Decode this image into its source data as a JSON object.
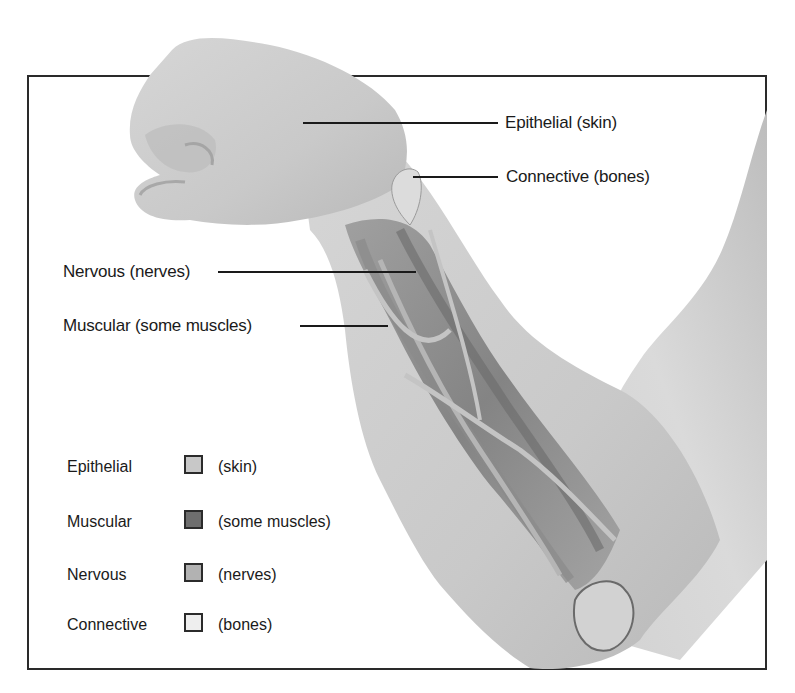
{
  "diagram": {
    "callouts": [
      {
        "id": "epithelial",
        "label": "Epithelial (skin)"
      },
      {
        "id": "connective",
        "label": "Connective (bones)"
      },
      {
        "id": "nervous",
        "label": "Nervous (nerves)"
      },
      {
        "id": "muscular",
        "label": "Muscular (some muscles)"
      }
    ],
    "legend": [
      {
        "name": "Epithelial",
        "desc": "(skin)",
        "color": "#c8c8c8"
      },
      {
        "name": "Muscular",
        "desc": "(some muscles)",
        "color": "#6e6e6e"
      },
      {
        "name": "Nervous",
        "desc": "(nerves)",
        "color": "#b2b2b2"
      },
      {
        "name": "Connective",
        "desc": "(bones)",
        "color": "#eeeeee"
      }
    ]
  }
}
